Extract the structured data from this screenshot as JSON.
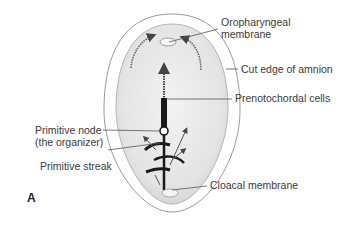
{
  "figure": {
    "panel_label": "A",
    "labels": {
      "oropharyngeal_membrane_line1": "Oropharyngeal",
      "oropharyngeal_membrane_line2": "membrane",
      "cut_edge_of_amnion": "Cut edge of amnion",
      "prenotochordal_cells": "Prenotochordal cells",
      "primitive_node_line1": "Primitive node",
      "primitive_node_line2": "(the organizer)",
      "primitive_streak": "Primitive streak",
      "cloacal_membrane": "Cloacal membrane"
    },
    "colors": {
      "background": "#ffffff",
      "embryo_fill": "#e8e8e8",
      "outline": "#9a9a9a",
      "text": "#3a3a3a",
      "leader_line": "#555555",
      "structures": "#1a1a1a"
    }
  }
}
